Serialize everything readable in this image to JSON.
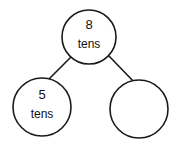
{
  "diagram": {
    "type": "number-bond",
    "background_color": "#ffffff",
    "stroke_color": "#1a1a1a",
    "text_color": "#111111",
    "nodes": [
      {
        "id": "total",
        "role": "total",
        "value": "8",
        "unit": "tens",
        "empty": false,
        "cx": 89,
        "cy": 37,
        "r": 27
      },
      {
        "id": "part-left",
        "role": "part",
        "value": "5",
        "unit": "tens",
        "empty": false,
        "cx": 42,
        "cy": 107,
        "r": 29
      },
      {
        "id": "part-right",
        "role": "part",
        "value": "",
        "unit": "",
        "empty": true,
        "cx": 139,
        "cy": 109,
        "r": 29
      }
    ],
    "links": [
      {
        "id": "link-total-left",
        "from": "total",
        "to": "part-left",
        "x1": 71,
        "y1": 57,
        "x2": 45,
        "y2": 83
      },
      {
        "id": "link-total-right",
        "from": "total",
        "to": "part-right",
        "x1": 109,
        "y1": 56,
        "x2": 135,
        "y2": 83
      }
    ]
  }
}
